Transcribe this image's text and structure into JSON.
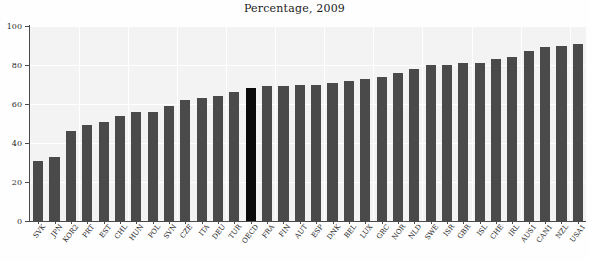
{
  "chart": {
    "title": "Percentage, 2009",
    "axis": {
      "y_ticks": [
        "0",
        "20",
        "40",
        "60",
        "80",
        "100"
      ],
      "y_min": 0,
      "y_max": 100
    }
  },
  "chart_data": {
    "type": "bar",
    "title": "Percentage, 2009",
    "xlabel": "",
    "ylabel": "",
    "ylim": [
      0,
      100
    ],
    "yticks": [
      0,
      20,
      40,
      60,
      80,
      100
    ],
    "grid": true,
    "legend": "none",
    "bar_color": "#4a4a4a",
    "highlight_color": "#0a0a0a",
    "highlight_category": "OECD",
    "categories": [
      "SVK",
      "JPN",
      "KOR2",
      "PRT",
      "EST",
      "CHL",
      "HUN",
      "POL",
      "SVN",
      "CZE",
      "ITA",
      "DEU",
      "TUR",
      "OECD",
      "FRA",
      "FIN",
      "AUT",
      "ESP",
      "DNK",
      "BEL",
      "LUX",
      "GRC",
      "NOR",
      "NLD",
      "SWE",
      "ISR",
      "GBR",
      "ISL",
      "CHE",
      "IRL",
      "AUS1",
      "CAN1",
      "NZL",
      "USA1"
    ],
    "values": [
      31,
      33,
      46,
      49,
      51,
      54,
      56,
      56,
      59,
      62,
      63,
      64,
      66,
      68,
      69,
      69,
      70,
      70,
      71,
      72,
      73,
      74,
      76,
      78,
      80,
      80,
      81,
      81,
      83,
      84,
      87,
      89,
      90,
      91
    ]
  }
}
